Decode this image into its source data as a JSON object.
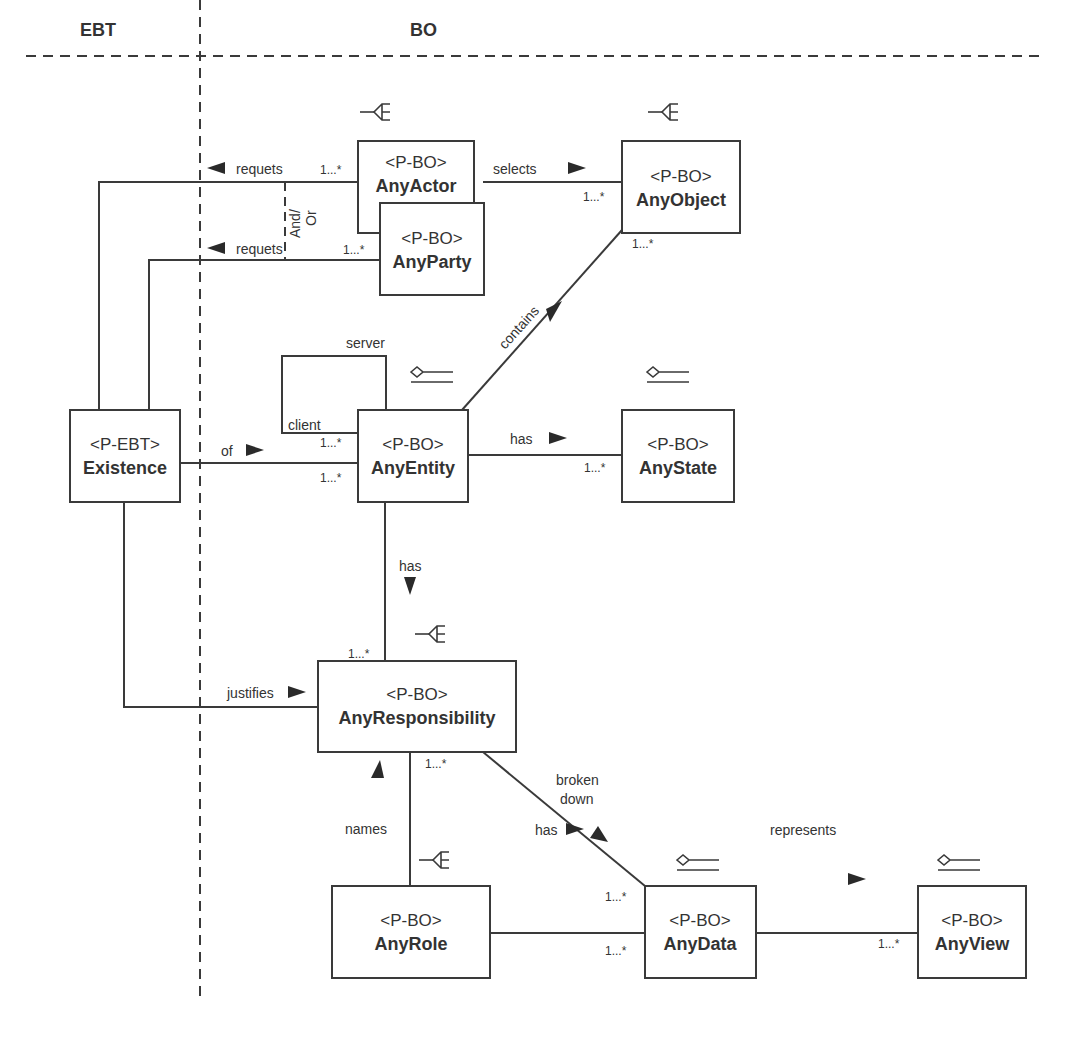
{
  "headers": {
    "left": "EBT",
    "right": "BO"
  },
  "classes": {
    "any_actor": {
      "stereotype": "<P-BO>",
      "name": "AnyActor"
    },
    "any_party": {
      "stereotype": "<P-BO>",
      "name": "AnyParty"
    },
    "any_object": {
      "stereotype": "<P-BO>",
      "name": "AnyObject"
    },
    "existence": {
      "stereotype": "<P-EBT>",
      "name": "Existence"
    },
    "any_entity": {
      "stereotype": "<P-BO>",
      "name": "AnyEntity"
    },
    "any_state": {
      "stereotype": "<P-BO>",
      "name": "AnyState"
    },
    "any_responsibility": {
      "stereotype": "<P-BO>",
      "name": "AnyResponsibility"
    },
    "any_role": {
      "stereotype": "<P-BO>",
      "name": "AnyRole"
    },
    "any_data": {
      "stereotype": "<P-BO>",
      "name": "AnyData"
    },
    "any_view": {
      "stereotype": "<P-BO>",
      "name": "AnyView"
    }
  },
  "associations": {
    "requets_actor": "requets",
    "requets_party": "requets",
    "and_or_1": "And/",
    "and_or_2": "Or",
    "selects": "selects",
    "contains": "contains",
    "server": "server",
    "client": "client",
    "of": "of",
    "has_state": "has",
    "has_resp": "has",
    "justifies": "justifies",
    "broken_1": "broken",
    "broken_2": "down",
    "names": "names",
    "has_data": "has",
    "represents": "represents"
  },
  "multiplicity": "1...*",
  "pattern_icons": [
    "crowsfoot-icon",
    "aggregation-icon"
  ]
}
